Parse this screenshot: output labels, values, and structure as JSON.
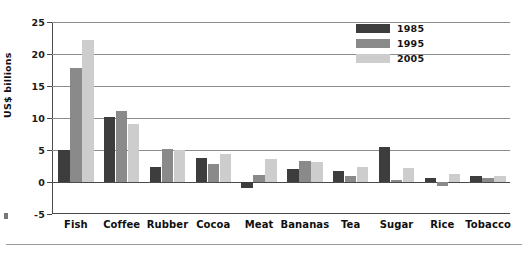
{
  "chart_data": {
    "type": "bar",
    "title": "",
    "subtitle": "",
    "xlabel": "",
    "ylabel": "US$ billions",
    "ylim": [
      -5,
      25
    ],
    "ytick_values": [
      25,
      20,
      15,
      10,
      5,
      0,
      -5
    ],
    "ytick_labels": [
      "25",
      "20",
      "15",
      "10",
      "5",
      "0",
      "-5"
    ],
    "grid": true,
    "grid_axis": "y",
    "legend_position": "top-right",
    "categories": [
      "Fish",
      "Coffee",
      "Rubber",
      "Cocoa",
      "Meat",
      "Bananas",
      "Tea",
      "Sugar",
      "Rice",
      "Tobacco"
    ],
    "series": [
      {
        "name": "1985",
        "color": "#3d3d3d",
        "values": [
          5.0,
          10.2,
          2.3,
          3.7,
          -1.0,
          2.1,
          1.7,
          5.5,
          0.6,
          0.9
        ]
      },
      {
        "name": "1995",
        "color": "#8a8a8a",
        "values": [
          17.8,
          11.1,
          5.1,
          2.8,
          1.1,
          3.3,
          1.0,
          0.3,
          -0.7,
          0.7
        ]
      },
      {
        "name": "2005",
        "color": "#cdcdcd",
        "values": [
          22.2,
          9.1,
          5.0,
          4.3,
          3.6,
          3.2,
          2.4,
          2.2,
          1.2,
          1.0
        ]
      }
    ]
  },
  "legend": {
    "items": [
      {
        "label": "1985",
        "color": "#3d3d3d"
      },
      {
        "label": "1995",
        "color": "#8a8a8a"
      },
      {
        "label": "2005",
        "color": "#cdcdcd"
      }
    ]
  },
  "axis": {
    "y_title": "US$ billions"
  },
  "colors": {
    "axis": "#4a4a4a",
    "grid": "#8c8c8c",
    "text": "#111111",
    "background": "#ffffff"
  }
}
